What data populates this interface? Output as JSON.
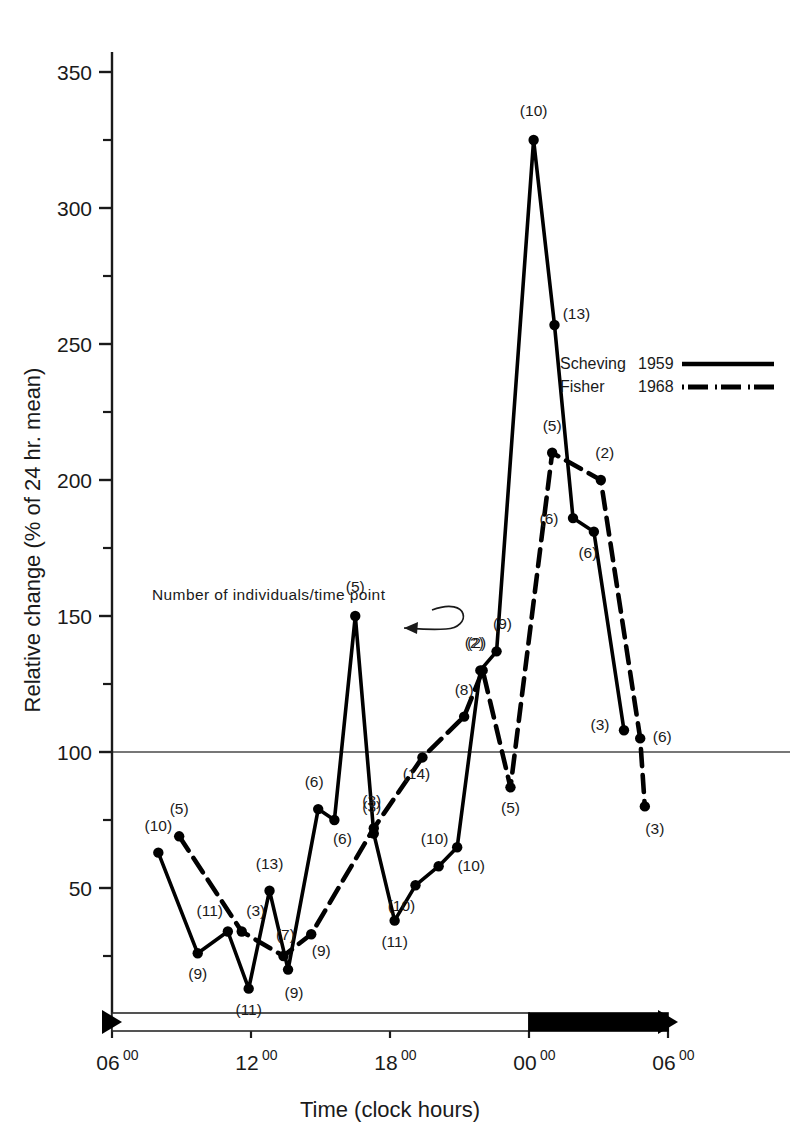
{
  "chart_data": {
    "type": "line",
    "title": "",
    "xlabel": "Time (clock hours)",
    "ylabel": "Relative change (% of 24 hr. mean)",
    "xlim": [
      6,
      30
    ],
    "ylim": [
      0,
      360
    ],
    "yticks": [
      50,
      100,
      150,
      200,
      250,
      300,
      350
    ],
    "ytick_labels": [
      "50",
      "100",
      "150",
      "200",
      "250",
      "300",
      "350"
    ],
    "yminor_ticks": [
      25,
      75,
      125,
      175,
      225,
      275,
      325
    ],
    "xticks": [
      6,
      12,
      18,
      24,
      30
    ],
    "xtick_labels": [
      "06",
      "12",
      "18",
      "00",
      "06"
    ],
    "xtick_superscript": "00",
    "grid": false,
    "reference_line_y": 100,
    "legend_position": "right-middle",
    "annotation": {
      "text": "Number of individuals/time point",
      "points_to": "(5)",
      "x": 152,
      "y": 600
    },
    "point_label_note": "values in parentheses are number of individuals per time point",
    "series": [
      {
        "name": "Scheving 1959",
        "style": "solid",
        "color": "#000000",
        "points": [
          {
            "x": 8.0,
            "y": 63,
            "n": "(10)",
            "lx": 0,
            "ly": -22
          },
          {
            "x": 9.7,
            "y": 26,
            "n": "(9)",
            "lx": 0,
            "ly": 26
          },
          {
            "x": 11.0,
            "y": 34,
            "n": "(11)",
            "lx": -18,
            "ly": -16
          },
          {
            "x": 11.9,
            "y": 13,
            "n": "(11)",
            "lx": 0,
            "ly": 26
          },
          {
            "x": 12.8,
            "y": 49,
            "n": "(13)",
            "lx": 0,
            "ly": -22
          },
          {
            "x": 13.6,
            "y": 20,
            "n": "(9)",
            "lx": 6,
            "ly": 28
          },
          {
            "x": 14.9,
            "y": 79,
            "n": "(6)",
            "lx": -4,
            "ly": -22
          },
          {
            "x": 15.6,
            "y": 75,
            "n": "(6)",
            "lx": 8,
            "ly": 24
          },
          {
            "x": 16.5,
            "y": 150,
            "n": "(5)",
            "lx": 0,
            "ly": -24
          },
          {
            "x": 17.3,
            "y": 70,
            "n": "(3)",
            "lx": -2,
            "ly": -22
          },
          {
            "x": 18.2,
            "y": 38,
            "n": "(11)",
            "lx": 0,
            "ly": 26
          },
          {
            "x": 19.1,
            "y": 51,
            "n": "(10)",
            "lx": -14,
            "ly": 26
          },
          {
            "x": 20.1,
            "y": 58,
            "n": "(10)",
            "lx": -4,
            "ly": -22
          },
          {
            "x": 20.9,
            "y": 65,
            "n": "(10)",
            "lx": 14,
            "ly": 24
          },
          {
            "x": 21.9,
            "y": 130,
            "n": "(2)",
            "lx": -6,
            "ly": -22
          },
          {
            "x": 22.6,
            "y": 137,
            "n": "(9)",
            "lx": 6,
            "ly": -22
          },
          {
            "x": 24.2,
            "y": 325,
            "n": "(10)",
            "lx": 0,
            "ly": -24
          },
          {
            "x": 25.1,
            "y": 257,
            "n": "(13)",
            "lx": 22,
            "ly": -6
          },
          {
            "x": 25.9,
            "y": 186,
            "n": "(6)",
            "lx": -24,
            "ly": 6
          },
          {
            "x": 26.8,
            "y": 181,
            "n": "(6)",
            "lx": -6,
            "ly": 26
          },
          {
            "x": 28.1,
            "y": 108,
            "n": "(3)",
            "lx": -24,
            "ly": 0
          }
        ]
      },
      {
        "name": "Fisher 1968",
        "style": "dashed",
        "color": "#000000",
        "points": [
          {
            "x": 8.9,
            "y": 69,
            "n": "(5)",
            "lx": 0,
            "ly": -22
          },
          {
            "x": 11.6,
            "y": 34,
            "n": "(3)",
            "lx": 14,
            "ly": -16
          },
          {
            "x": 13.4,
            "y": 25,
            "n": "(7)",
            "lx": 2,
            "ly": -16
          },
          {
            "x": 14.6,
            "y": 33,
            "n": "(9)",
            "lx": 10,
            "ly": 22
          },
          {
            "x": 17.3,
            "y": 72,
            "n": "(3)",
            "lx": -2,
            "ly": -22
          },
          {
            "x": 19.4,
            "y": 98,
            "n": "(14)",
            "lx": -6,
            "ly": 22
          },
          {
            "x": 21.2,
            "y": 113,
            "n": "(8)",
            "lx": 0,
            "ly": -22
          },
          {
            "x": 22.0,
            "y": 130,
            "n": "(2)",
            "lx": -6,
            "ly": -22
          },
          {
            "x": 23.2,
            "y": 87,
            "n": "(5)",
            "lx": 0,
            "ly": 26
          },
          {
            "x": 25.0,
            "y": 210,
            "n": "(5)",
            "lx": 0,
            "ly": -22
          },
          {
            "x": 27.1,
            "y": 200,
            "n": "(2)",
            "lx": 4,
            "ly": -22
          },
          {
            "x": 28.8,
            "y": 105,
            "n": "(6)",
            "lx": 22,
            "ly": 4
          },
          {
            "x": 29.0,
            "y": 80,
            "n": "(3)",
            "lx": 10,
            "ly": 28
          }
        ]
      }
    ],
    "daybar": {
      "light_start": 6,
      "light_end": 24,
      "dark_start": 24,
      "dark_end": 30,
      "light_color": "#ffffff",
      "dark_color": "#000000"
    }
  },
  "legend": {
    "entries": [
      {
        "author": "Scheving",
        "year": "1959",
        "style": "solid"
      },
      {
        "author": "Fisher",
        "year": "1968",
        "style": "dashed"
      }
    ]
  }
}
